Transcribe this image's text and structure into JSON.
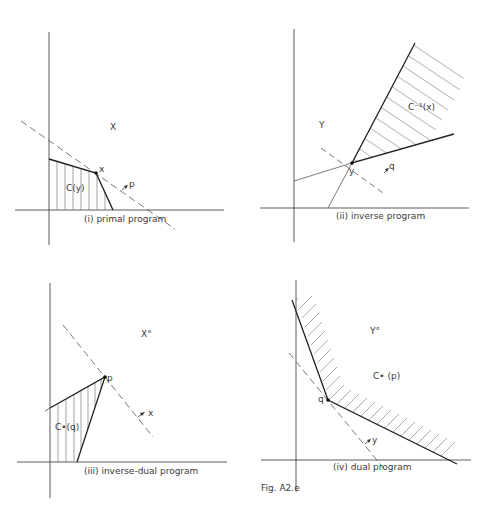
{
  "figure": {
    "caption": "Fig. A2.e",
    "stroke_color": "#2a2a2a",
    "dash_color": "#555555",
    "hatch_color": "#666666"
  },
  "panels": [
    {
      "id": "i",
      "caption": "(i) primal program",
      "space_label": "X",
      "set_label": "C(y)",
      "point_label": "x",
      "normal_label": "p"
    },
    {
      "id": "ii",
      "caption": "(ii) inverse program",
      "space_label": "Y",
      "set_label": "C⁻¹(x)",
      "point_label": "y",
      "normal_label": "q"
    },
    {
      "id": "iii",
      "caption": "(iii) inverse-dual program",
      "space_label": "X°",
      "set_label": "C•(q)",
      "point_label": "p",
      "normal_label": "x"
    },
    {
      "id": "iv",
      "caption": "(iv) dual program",
      "space_label": "Y°",
      "set_label": "C• (p)",
      "point_label": "q",
      "normal_label": "y"
    }
  ]
}
